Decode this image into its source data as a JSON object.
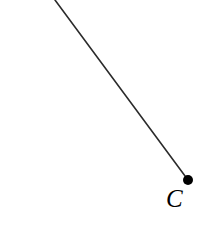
{
  "figure": {
    "background_color": "#ffffff",
    "width": 217,
    "height": 229,
    "stroke_color": "#2b2b2b",
    "point_color": "#000000"
  },
  "labels": {
    "point_c": "C"
  },
  "chart_data": {
    "type": "scatter",
    "title": "",
    "xlabel": "",
    "ylabel": "",
    "xlim": [
      0,
      217
    ],
    "ylim": [
      0,
      229
    ],
    "grid": false,
    "legend": "none",
    "annotations": [
      {
        "text": "C",
        "x": 172,
        "y": 198
      }
    ],
    "series": [
      {
        "name": "ray-segment",
        "type": "line",
        "stroke": "#2b2b2b",
        "stroke_width": 1.6,
        "x": [
          55,
          188
        ],
        "y": [
          0,
          180
        ]
      },
      {
        "name": "point-c",
        "type": "scatter",
        "marker": "filled-circle",
        "color": "#000000",
        "radius": 5,
        "x": [
          188
        ],
        "y": [
          180
        ]
      }
    ]
  }
}
